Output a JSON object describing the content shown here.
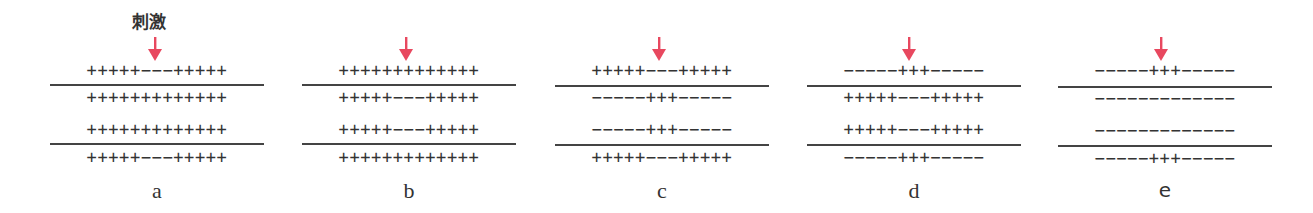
{
  "stimulus_label": "刺激",
  "arrow_color": "#e8485f",
  "panels": [
    {
      "label": "a",
      "rows": [
        "+++++−−−+++++",
        "+++++++++++++",
        "+++++++++++++",
        "+++++−−−+++++"
      ]
    },
    {
      "label": "b",
      "rows": [
        "+++++++++++++",
        "+++++−−−+++++",
        "+++++−−−+++++",
        "+++++++++++++"
      ]
    },
    {
      "label": "c",
      "rows": [
        "+++++−−−+++++",
        "−−−−−+++−−−−−",
        "−−−−−+++−−−−−",
        "+++++−−−+++++"
      ]
    },
    {
      "label": "d",
      "rows": [
        "−−−−−+++−−−−−",
        "+++++−−−+++++",
        "+++++−−−+++++",
        "−−−−−+++−−−−−"
      ]
    },
    {
      "label": "e",
      "rows": [
        "−−−−−+++−−−−−",
        "−−−−−−−−−−−−−",
        "−−−−−−−−−−−−−",
        "−−−−−+++−−−−−"
      ]
    }
  ]
}
